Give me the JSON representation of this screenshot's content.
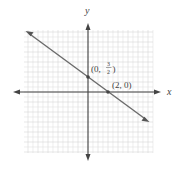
{
  "chart_data": {
    "type": "line",
    "title": "",
    "xlabel": "x",
    "ylabel": "y",
    "xlim": [
      -6.4,
      6.4
    ],
    "ylim": [
      -6,
      6.2
    ],
    "grid": true,
    "grid_minor_step": 0.5,
    "series": [
      {
        "name": "line",
        "equation": "y = -3/4 x + 3/2",
        "x": [
          -6.1,
          6.0
        ],
        "y": [
          6.075,
          -3.0
        ],
        "color": "#6b6b6b"
      }
    ],
    "annotations": [
      {
        "point": [
          0,
          1.5
        ],
        "label": "(0, 3/2)",
        "label_display": {
          "open": "(0, ",
          "num": "3",
          "den": "2",
          "close": ")"
        }
      },
      {
        "point": [
          2,
          0
        ],
        "label": "(2, 0)"
      }
    ]
  },
  "labels": {
    "x_axis": "x",
    "y_axis": "y",
    "point1_prefix": "(0,",
    "point1_num": "3",
    "point1_den": "2",
    "point1_close": ")",
    "point2": "(2, 0)"
  }
}
